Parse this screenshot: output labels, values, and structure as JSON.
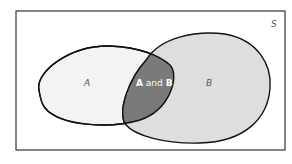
{
  "diagram": {
    "type": "venn",
    "universe_label": "S",
    "sets": [
      {
        "name": "A",
        "label": "A",
        "fill": "#f2f2f2"
      },
      {
        "name": "B",
        "label": "B",
        "fill": "#dcdcdc"
      }
    ],
    "intersection": {
      "label_parts": [
        "A",
        " and ",
        "B"
      ],
      "fill": "#7a7a7a",
      "text_color": "#ffffff"
    },
    "border_color": "#222222"
  }
}
